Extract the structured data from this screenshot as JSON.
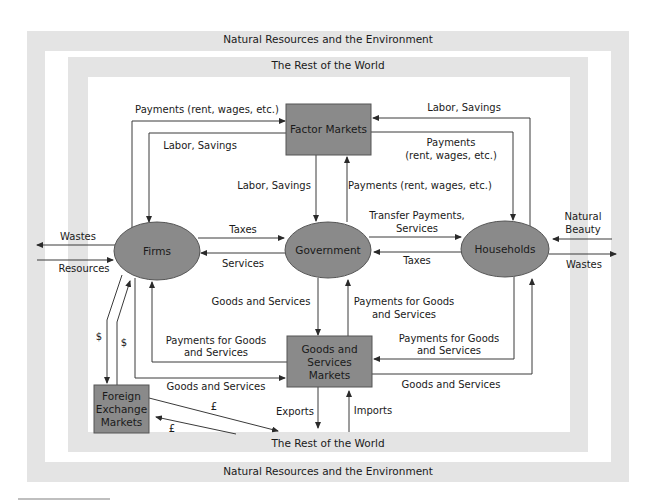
{
  "diagram": {
    "colors": {
      "frame": "#e4e4e4",
      "node_fill": "#8a8a8a",
      "node_stroke": "#555555",
      "line": "#3a3a3a",
      "text": "#1a1a1a"
    },
    "frames": {
      "outer_top": "Natural Resources and the Environment",
      "outer_bottom": "Natural Resources and the Environment",
      "inner_top": "The Rest of the World",
      "inner_bottom": "The Rest of the World"
    },
    "nodes": {
      "factor_markets": "Factor Markets",
      "firms": "Firms",
      "government": "Government",
      "households": "Households",
      "goods_markets_l1": "Goods and",
      "goods_markets_l2": "Services",
      "goods_markets_l3": "Markets",
      "fx_l1": "Foreign",
      "fx_l2": "Exchange",
      "fx_l3": "Markets"
    },
    "flows": {
      "firms_to_factor_payments": "Payments (rent, wages, etc.)",
      "factor_to_firms_labor": "Labor, Savings",
      "factor_to_gov_labor": "Labor, Savings",
      "gov_to_factor_payments": "Payments (rent, wages, etc.)",
      "households_to_factor_labor": "Labor, Savings",
      "factor_to_households_payments_l1": "Payments",
      "factor_to_households_payments_l2": "(rent, wages, etc.)",
      "firms_wastes": "Wastes",
      "resources_to_firms": "Resources",
      "firms_to_gov_taxes": "Taxes",
      "gov_to_firms_services": "Services",
      "gov_to_households_l1": "Transfer Payments,",
      "gov_to_households_l2": "Services",
      "households_to_gov_taxes": "Taxes",
      "natural_beauty_l1": "Natural",
      "natural_beauty_l2": "Beauty",
      "households_wastes": "Wastes",
      "gov_to_goods": "Goods and Services",
      "goods_to_gov_payments_l1": "Payments for Goods",
      "goods_to_gov_payments_l2": "and Services",
      "goods_to_firms_payments_l1": "Payments for Goods",
      "goods_to_firms_payments_l2": "and Services",
      "households_to_goods_payments_l1": "Payments for Goods",
      "households_to_goods_payments_l2": "and Services",
      "firms_to_goods": "Goods and Services",
      "goods_to_households": "Goods and Services",
      "exports": "Exports",
      "imports": "Imports",
      "dollar_1": "$",
      "dollar_2": "$",
      "pound_1": "£",
      "pound_2": "£"
    }
  }
}
